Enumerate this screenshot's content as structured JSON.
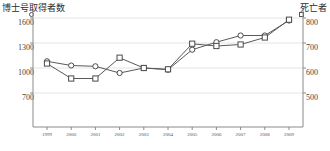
{
  "chart_data": {
    "type": "line",
    "title": "",
    "categories": [
      "1999",
      "2000",
      "2001",
      "2002",
      "2003",
      "2004",
      "2005",
      "2006",
      "2007",
      "2008",
      "2009"
    ],
    "xlabel": "",
    "grid": true,
    "legend_position": "axis-top",
    "series": [
      {
        "name": "博士号取得者数",
        "marker": "circle",
        "axis": "left",
        "ylabel": "博士号取得者数",
        "ylim": [
          700,
          1600
        ],
        "yticks": [
          700,
          1000,
          1300,
          1600
        ],
        "values": [
          1080,
          1030,
          1020,
          940,
          1000,
          980,
          1220,
          1310,
          1390,
          1390,
          1570
        ]
      },
      {
        "name": "死亡者",
        "marker": "square",
        "axis": "right",
        "ylabel": "死亡者",
        "ylim": [
          500,
          800
        ],
        "yticks": [
          500,
          600,
          700,
          800
        ],
        "values": [
          618,
          558,
          558,
          641,
          600,
          595,
          697,
          688,
          694,
          722,
          793
        ]
      }
    ]
  },
  "axes": {
    "left_title": "博士号取得者数",
    "right_title": "死亡者",
    "left_ticks": [
      "1600",
      "1300",
      "1000",
      "700"
    ],
    "right_ticks": [
      "800",
      "700",
      "600",
      "500"
    ],
    "x_ticks": [
      "1999",
      "2000",
      "2001",
      "2002",
      "2003",
      "2004",
      "2005",
      "2006",
      "2007",
      "2008",
      "2009"
    ]
  },
  "legend": {
    "left_marker": "circle-marker-icon",
    "right_marker": "square-marker-icon"
  },
  "colors": {
    "line": "#595959",
    "marker_fill": "#ffffff",
    "marker_stroke": "#4a4a4a",
    "grid": "#e4e4e4",
    "axis": "#8a8a8a",
    "text": "#3a3a3a"
  }
}
